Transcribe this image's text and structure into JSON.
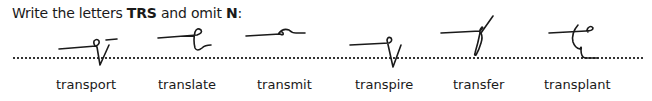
{
  "instruction": {
    "prefix": "Write the letters ",
    "letters_keep": "TRS",
    "middle": " and omit ",
    "letter_omit": "N",
    "suffix": ":"
  },
  "words": [
    {
      "label": "transport",
      "x": 56
    },
    {
      "label": "translate",
      "x": 158
    },
    {
      "label": "transmit",
      "x": 257
    },
    {
      "label": "transpire",
      "x": 355
    },
    {
      "label": "transfer",
      "x": 453
    },
    {
      "label": "transplant",
      "x": 544
    }
  ],
  "colors": {
    "ink": "#1a1a1a",
    "dots": "#333333"
  }
}
